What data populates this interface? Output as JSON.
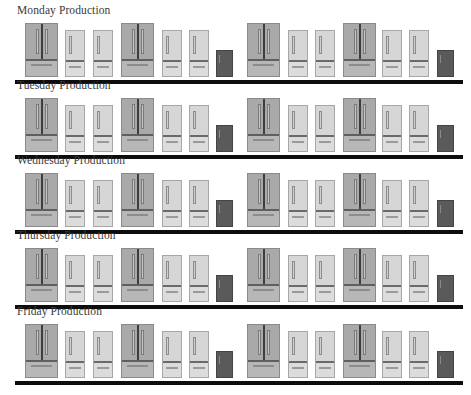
{
  "sections": [
    {
      "title": "Monday Production"
    },
    {
      "title": "Tuesday Production"
    },
    {
      "title": "Wednesday Production"
    },
    {
      "title": "Thursday Production"
    },
    {
      "title": "Friday Production"
    }
  ],
  "row_pattern": [
    "large-french-door-fridge",
    "small-fridge",
    "small-fridge",
    "large-french-door-fridge",
    "small-fridge",
    "small-fridge",
    "mini-fridge",
    "large-french-door-fridge",
    "small-fridge",
    "small-fridge",
    "large-french-door-fridge",
    "small-fridge",
    "small-fridge",
    "mini-fridge"
  ],
  "colors": {
    "large_fridge": "#a9a9a9",
    "small_fridge": "#d6d6d6",
    "mini_fridge": "#5a5a5a",
    "divider": "#0d0d0d",
    "title_text": "#3a3a3a"
  }
}
